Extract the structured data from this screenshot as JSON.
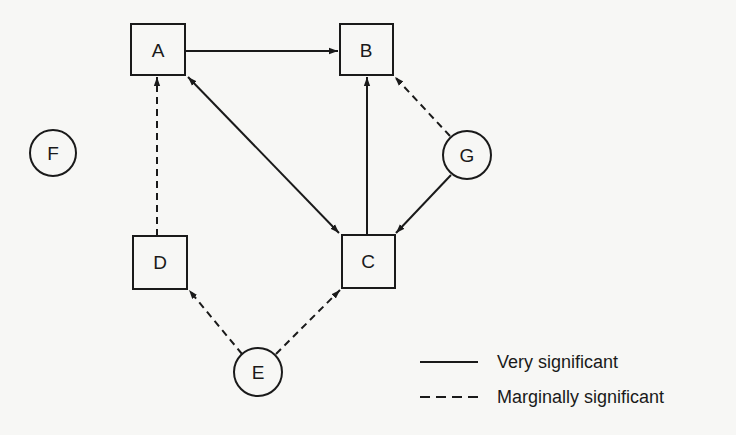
{
  "diagram": {
    "nodes": [
      {
        "id": "A",
        "label": "A",
        "shape": "box"
      },
      {
        "id": "B",
        "label": "B",
        "shape": "box"
      },
      {
        "id": "C",
        "label": "C",
        "shape": "box"
      },
      {
        "id": "D",
        "label": "D",
        "shape": "box"
      },
      {
        "id": "E",
        "label": "E",
        "shape": "circle"
      },
      {
        "id": "F",
        "label": "F",
        "shape": "circle"
      },
      {
        "id": "G",
        "label": "G",
        "shape": "circle"
      }
    ],
    "edges": [
      {
        "from": "A",
        "to": "B",
        "style": "solid"
      },
      {
        "from": "A",
        "to": "C",
        "style": "solid",
        "bidirectional": true
      },
      {
        "from": "C",
        "to": "B",
        "style": "solid"
      },
      {
        "from": "G",
        "to": "B",
        "style": "dashed"
      },
      {
        "from": "G",
        "to": "C",
        "style": "solid"
      },
      {
        "from": "D",
        "to": "A",
        "style": "dashed"
      },
      {
        "from": "E",
        "to": "D",
        "style": "dashed"
      },
      {
        "from": "E",
        "to": "C",
        "style": "dashed"
      }
    ]
  },
  "legend": {
    "solid_label": "Very significant",
    "dashed_label": "Marginally significant"
  },
  "colors": {
    "ink": "#1a1a1a",
    "background": "#f7f7f5"
  }
}
